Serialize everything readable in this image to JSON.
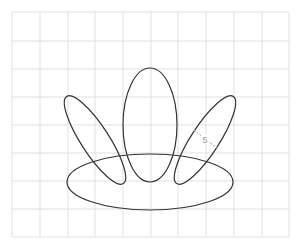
{
  "diagram": {
    "type": "geometry-figure",
    "grid": {
      "color": "#d9d9d9",
      "x_lines": [
        12,
        40,
        68,
        95,
        123,
        151,
        178,
        206,
        234,
        262,
        289
      ],
      "y_lines": [
        12,
        41,
        69,
        97,
        125,
        153,
        181,
        209,
        237
      ]
    },
    "shapes": [
      {
        "name": "bottom-ellipse",
        "cx": 150,
        "cy": 182,
        "rx": 83,
        "ry": 28,
        "rotate": 0
      },
      {
        "name": "center-ellipse",
        "cx": 150,
        "cy": 125,
        "rx": 27,
        "ry": 57,
        "rotate": 0
      },
      {
        "name": "left-ellipse",
        "cx": 95,
        "cy": 140,
        "rx": 14,
        "ry": 52,
        "rotate": -33
      },
      {
        "name": "right-ellipse",
        "cx": 205,
        "cy": 140,
        "rx": 14,
        "ry": 52,
        "rotate": 33
      }
    ],
    "stroke_color": "#333333",
    "dimension": {
      "label": "5",
      "color": "#999999",
      "x1": 194,
      "y1": 130,
      "x2": 217,
      "y2": 148,
      "label_x": 205,
      "label_y": 143
    }
  }
}
